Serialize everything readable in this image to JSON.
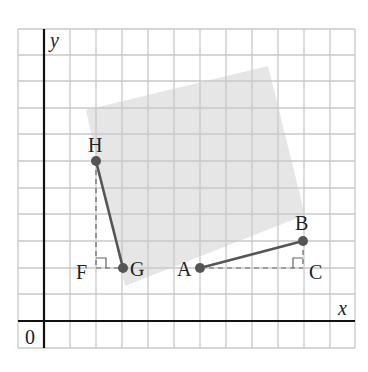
{
  "figure": {
    "axes": {
      "x_label": "x",
      "y_label": "y",
      "origin_label": "0"
    },
    "grid": {
      "columns": 13,
      "rows": 12,
      "cell_px": 26
    },
    "points": {
      "H": {
        "label": "H",
        "grid": [
          2,
          6
        ]
      },
      "G": {
        "label": "G",
        "grid": [
          3,
          2
        ]
      },
      "A": {
        "label": "A",
        "grid": [
          6,
          2
        ]
      },
      "B": {
        "label": "B",
        "grid": [
          10,
          3
        ]
      },
      "F": {
        "label": "F",
        "grid": [
          2,
          2
        ]
      },
      "C": {
        "label": "C",
        "grid": [
          10,
          2
        ]
      }
    },
    "segments": [
      {
        "from": "H",
        "to": "G",
        "style": "solid"
      },
      {
        "from": "A",
        "to": "B",
        "style": "solid"
      },
      {
        "from": "H",
        "to": "F",
        "style": "dashed"
      },
      {
        "from": "F",
        "to": "G",
        "style": "dashed"
      },
      {
        "from": "A",
        "to": "C",
        "style": "dashed"
      },
      {
        "from": "C",
        "to": "B",
        "style": "dashed"
      }
    ],
    "right_angles": [
      "F",
      "C"
    ],
    "shaded_square": "tilted gray square behind points",
    "colors": {
      "grid": "#c8c8c8",
      "axis": "#111111",
      "segment": "#555555",
      "point": "#555555",
      "shade": "#e6e6e6"
    }
  }
}
